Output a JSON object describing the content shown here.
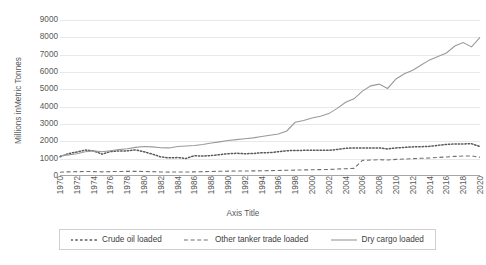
{
  "chart_data": {
    "type": "line",
    "title": "",
    "xlabel": "Axis Title",
    "ylabel": "Millions  inMetric Tonnes",
    "ylim": [
      0,
      9000
    ],
    "ytick_step": 1000,
    "yticks": [
      "0",
      "1000",
      "2000",
      "3000",
      "4000",
      "5000",
      "6000",
      "7000",
      "8000",
      "9000"
    ],
    "grid": true,
    "legend_position": "bottom",
    "x": [
      1970,
      1971,
      1972,
      1973,
      1974,
      1975,
      1976,
      1977,
      1978,
      1979,
      1980,
      1981,
      1982,
      1983,
      1984,
      1985,
      1986,
      1987,
      1988,
      1989,
      1990,
      1991,
      1992,
      1993,
      1994,
      1995,
      1996,
      1997,
      1998,
      1999,
      2000,
      2001,
      2002,
      2003,
      2004,
      2005,
      2006,
      2007,
      2008,
      2009,
      2010,
      2011,
      2012,
      2013,
      2014,
      2015,
      2016,
      2017,
      2018,
      2019,
      2020
    ],
    "xtick_labels": [
      "1970",
      "1972",
      "1974",
      "1976",
      "1978",
      "1980",
      "1982",
      "1984",
      "1986",
      "1988",
      "1990",
      "1992",
      "1994",
      "1996",
      "1998",
      "2000",
      "2002",
      "2004",
      "2006",
      "2008",
      "2010",
      "2012",
      "2014",
      "2016",
      "2018",
      "2020"
    ],
    "series": [
      {
        "name": "Crude oil loaded",
        "style": "dotted",
        "color": "#595959",
        "values": [
          1109,
          1295,
          1378,
          1497,
          1452,
          1263,
          1410,
          1444,
          1450,
          1508,
          1397,
          1261,
          1100,
          1046,
          1064,
          1013,
          1170,
          1150,
          1180,
          1230,
          1287,
          1310,
          1285,
          1300,
          1340,
          1350,
          1400,
          1460,
          1470,
          1480,
          1480,
          1490,
          1480,
          1530,
          1600,
          1620,
          1620,
          1620,
          1620,
          1560,
          1620,
          1650,
          1680,
          1690,
          1710,
          1770,
          1820,
          1850,
          1850,
          1860,
          1700
        ]
      },
      {
        "name": "Other tanker trade loaded",
        "style": "dashed",
        "color": "#707070",
        "values": [
          220,
          240,
          250,
          260,
          255,
          240,
          255,
          260,
          265,
          270,
          260,
          250,
          235,
          225,
          230,
          230,
          240,
          250,
          260,
          270,
          280,
          285,
          290,
          295,
          300,
          310,
          320,
          330,
          340,
          350,
          360,
          370,
          380,
          400,
          420,
          440,
          900,
          920,
          940,
          920,
          960,
          980,
          1000,
          1020,
          1040,
          1070,
          1100,
          1130,
          1150,
          1160,
          1080
        ]
      },
      {
        "name": "Dry cargo loaded",
        "style": "solid",
        "color": "#9a9a9a",
        "values": [
          1162,
          1220,
          1280,
          1400,
          1450,
          1400,
          1460,
          1520,
          1570,
          1650,
          1700,
          1680,
          1630,
          1620,
          1700,
          1730,
          1760,
          1820,
          1900,
          1970,
          2050,
          2100,
          2150,
          2200,
          2280,
          2350,
          2420,
          2600,
          3100,
          3200,
          3350,
          3450,
          3600,
          3900,
          4250,
          4450,
          4900,
          5200,
          5300,
          5050,
          5600,
          5900,
          6100,
          6400,
          6700,
          6900,
          7100,
          7500,
          7700,
          7450,
          8000
        ]
      }
    ]
  },
  "legend": {
    "items": [
      {
        "label": "Crude oil loaded",
        "style": "dotted"
      },
      {
        "label": "Other tanker trade loaded",
        "style": "dashed"
      },
      {
        "label": "Dry cargo loaded",
        "style": "solid"
      }
    ]
  },
  "colors": {
    "gridline": "#e8e8e8",
    "axis": "#a6a6a6",
    "text": "#595959",
    "legend_border": "#d0d0d0"
  }
}
